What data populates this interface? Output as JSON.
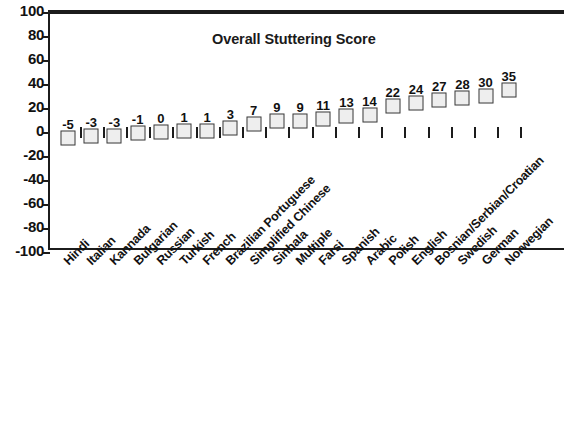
{
  "chart_data": {
    "type": "scatter",
    "title": "Overall Stuttering Score",
    "xlabel": "",
    "ylabel": "",
    "ylim": [
      -100,
      100
    ],
    "yticks": [
      100,
      80,
      60,
      40,
      20,
      0,
      -20,
      -40,
      -60,
      -80,
      -100
    ],
    "grid": false,
    "legend": null,
    "marker_style": "open-square",
    "marker_fill": "#eeeeee",
    "marker_edge": "#3a3a3a",
    "data_labels_shown": true,
    "note": "Rightmost category (Norwegian, value 35) is cropped at the image edge.",
    "categories": [
      "Hindi",
      "Italian",
      "Kannada",
      "Bulgarian",
      "Russian",
      "Turkish",
      "French",
      "Brazilian Portuguese",
      "Simplified Chinese",
      "Sinhala",
      "Multiple",
      "Farsi",
      "Spanish",
      "Arabic",
      "Polish",
      "English",
      "Bosnian/Serbian/Croatian",
      "Swedish",
      "German",
      "Norwegian"
    ],
    "values": [
      -5,
      -3,
      -3,
      -1,
      0,
      1,
      1,
      3,
      7,
      9,
      9,
      11,
      13,
      14,
      22,
      24,
      27,
      28,
      30,
      35
    ],
    "value_labels": [
      "-5",
      "-3",
      "-3",
      "-1",
      "0",
      "1",
      "1",
      "3",
      "7",
      "9",
      "9",
      "11",
      "13",
      "14",
      "22",
      "24",
      "27",
      "28",
      "30",
      "35"
    ]
  },
  "colors": {
    "axis": "#1c1c1c",
    "text": "#111111",
    "marker_fill": "#eeeeee",
    "marker_edge": "#3a3a3a",
    "background": "#ffffff"
  }
}
